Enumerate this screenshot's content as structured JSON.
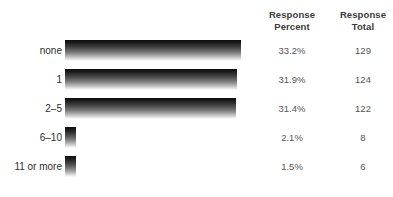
{
  "header": {
    "percent_line1": "Response",
    "percent_line2": "Percent",
    "total_line1": "Response",
    "total_line2": "Total"
  },
  "chart_data": {
    "type": "bar",
    "orientation": "horizontal",
    "title": "",
    "xlabel": "",
    "ylabel": "",
    "grid": false,
    "legend": null,
    "categories": [
      "none",
      "1",
      "2–5",
      "6–10",
      "11 or more"
    ],
    "values": [
      33.2,
      31.9,
      31.4,
      2.1,
      1.5
    ],
    "value_labels": [
      "33.2%",
      "31.9%",
      "31.4%",
      "2.1%",
      "1.5%"
    ],
    "counts": [
      129,
      124,
      122,
      8,
      6
    ],
    "count_labels": [
      "129",
      "124",
      "122",
      "8",
      "6"
    ],
    "columns": [
      "Response Percent",
      "Response Total"
    ],
    "bar_style": "vertical-gradient-black-to-white",
    "bar_color_top": "#0d0d0d",
    "bar_color_bottom": "#ffffff",
    "rows": [
      {
        "label": "none",
        "percent": "33.2%",
        "total": "129",
        "bar_px": 176,
        "top": 40
      },
      {
        "label": "1",
        "percent": "31.9%",
        "total": "124",
        "bar_px": 172,
        "top": 69
      },
      {
        "label": "2–5",
        "percent": "31.4%",
        "total": "122",
        "bar_px": 171,
        "top": 98
      },
      {
        "label": "6–10",
        "percent": "2.1%",
        "total": "8",
        "bar_px": 11,
        "top": 127
      },
      {
        "label": "11 or more",
        "percent": "1.5%",
        "total": "6",
        "bar_px": 11,
        "top": 156
      }
    ]
  }
}
